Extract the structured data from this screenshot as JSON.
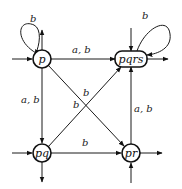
{
  "diagram": {
    "type": "automaton",
    "nodes": {
      "p": {
        "label": "p"
      },
      "pqrs": {
        "label": "pqrs"
      },
      "pq": {
        "label": "pq"
      },
      "pr": {
        "label": "pr"
      }
    },
    "edges": {
      "p_self": {
        "from": "p",
        "to": "p",
        "label": "b"
      },
      "pqrs_self": {
        "from": "pqrs",
        "to": "pqrs",
        "label": "b"
      },
      "p_to_pqrs": {
        "from": "p",
        "to": "pqrs",
        "label": "a, b"
      },
      "p_to_pq": {
        "from": "p",
        "to": "pq",
        "label": "a, b"
      },
      "p_to_pr": {
        "from": "p",
        "to": "pr",
        "label": "b"
      },
      "pq_to_pqrs": {
        "from": "pq",
        "to": "pqrs",
        "label": "b"
      },
      "pq_to_pr": {
        "from": "pq",
        "to": "pr",
        "label": "b"
      },
      "pr_to_pqrs": {
        "from": "pr",
        "to": "pqrs",
        "label": "a, b"
      }
    },
    "colors": {
      "stroke": "#111111",
      "background": "#ffffff"
    }
  }
}
